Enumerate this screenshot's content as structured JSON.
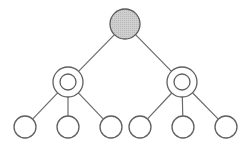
{
  "diagram": {
    "type": "tree",
    "colors": {
      "stroke": "#5f5f5f",
      "edge": "#6b6b6b",
      "root_fill": "#c8c8c8",
      "node_fill": "#ffffff",
      "background": "#ffffff"
    },
    "root": {
      "id": "root",
      "x": 125,
      "y": 24,
      "r": 15,
      "style": "filled"
    },
    "middle": [
      {
        "id": "mid-left",
        "x": 68,
        "y": 82,
        "r": 15,
        "inner_r": 8,
        "style": "double"
      },
      {
        "id": "mid-right",
        "x": 182,
        "y": 82,
        "r": 15,
        "inner_r": 8,
        "style": "double"
      }
    ],
    "leaves": [
      {
        "id": "leaf-1",
        "parent": "mid-left",
        "x": 25,
        "y": 127,
        "r": 11
      },
      {
        "id": "leaf-2",
        "parent": "mid-left",
        "x": 68,
        "y": 127,
        "r": 11
      },
      {
        "id": "leaf-3",
        "parent": "mid-left",
        "x": 111,
        "y": 127,
        "r": 11
      },
      {
        "id": "leaf-4",
        "parent": "mid-right",
        "x": 140,
        "y": 127,
        "r": 11
      },
      {
        "id": "leaf-5",
        "parent": "mid-right",
        "x": 183,
        "y": 127,
        "r": 11
      },
      {
        "id": "leaf-6",
        "parent": "mid-right",
        "x": 226,
        "y": 127,
        "r": 11
      }
    ]
  }
}
